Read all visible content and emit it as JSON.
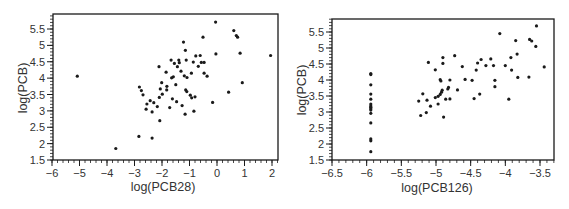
{
  "chart_data": [
    {
      "type": "scatter",
      "title": "",
      "xlabel": "log(PCB28)",
      "ylabel": "log(PCB)",
      "xlim": [
        -6,
        2.2
      ],
      "ylim": [
        1.5,
        5.9
      ],
      "xticks": [
        -6,
        -5,
        -4,
        -3,
        -2,
        -1,
        0,
        1,
        2
      ],
      "xtick_labels": [
        "−6",
        "−5",
        "−4",
        "−3",
        "−2",
        "−1",
        "0",
        "1",
        "2"
      ],
      "yticks": [
        1.5,
        2,
        2.5,
        3,
        3.5,
        4,
        4.5,
        5,
        5.5
      ],
      "ytick_labels": [
        "1.5",
        "2",
        "2.5",
        "3",
        "3.5",
        "4",
        "4.5",
        "5",
        "5.5"
      ],
      "grid": false,
      "legend": null,
      "points": [
        [
          -5.08,
          4.06
        ],
        [
          -3.68,
          1.85
        ],
        [
          -2.82,
          3.73
        ],
        [
          -2.75,
          3.62
        ],
        [
          -2.84,
          2.22
        ],
        [
          -2.36,
          2.17
        ],
        [
          -2.69,
          3.49
        ],
        [
          -2.55,
          3.21
        ],
        [
          -2.43,
          3.31
        ],
        [
          -2.58,
          3.05
        ],
        [
          -2.36,
          2.97
        ],
        [
          -2.3,
          3.25
        ],
        [
          -2.17,
          3.13
        ],
        [
          -2.11,
          4.35
        ],
        [
          -2.1,
          3.41
        ],
        [
          -2.08,
          2.7
        ],
        [
          -2.06,
          3.67
        ],
        [
          -2.01,
          3.86
        ],
        [
          -1.99,
          3.51
        ],
        [
          -1.85,
          4.18
        ],
        [
          -1.83,
          3.64
        ],
        [
          -1.82,
          3.75
        ],
        [
          -1.72,
          3.1
        ],
        [
          -1.67,
          4.55
        ],
        [
          -1.65,
          4.01
        ],
        [
          -1.62,
          3.37
        ],
        [
          -1.59,
          4.04
        ],
        [
          -1.55,
          4.45
        ],
        [
          -1.5,
          3.8
        ],
        [
          -1.47,
          3.28
        ],
        [
          -1.44,
          4.35
        ],
        [
          -1.39,
          4.55
        ],
        [
          -1.37,
          4.47
        ],
        [
          -1.31,
          4.21
        ],
        [
          -1.27,
          3.16
        ],
        [
          -1.22,
          5.1
        ],
        [
          -1.19,
          4.07
        ],
        [
          -1.16,
          2.9
        ],
        [
          -1.15,
          4.85
        ],
        [
          -1.14,
          3.64
        ],
        [
          -1.12,
          4.55
        ],
        [
          -1.09,
          4.02
        ],
        [
          -1.1,
          3.59
        ],
        [
          -0.97,
          3.48
        ],
        [
          -0.93,
          4.15
        ],
        [
          -0.92,
          3.4
        ],
        [
          -0.86,
          4.49
        ],
        [
          -0.84,
          2.99
        ],
        [
          -0.8,
          3.43
        ],
        [
          -0.77,
          4.68
        ],
        [
          -0.68,
          4.36
        ],
        [
          -0.61,
          4.69
        ],
        [
          -0.57,
          4.48
        ],
        [
          -0.51,
          5.25
        ],
        [
          -0.47,
          4.48
        ],
        [
          -0.47,
          4.15
        ],
        [
          -0.36,
          4.06
        ],
        [
          -0.16,
          3.26
        ],
        [
          -0.05,
          5.71
        ],
        [
          -0.04,
          4.74
        ],
        [
          0.42,
          3.57
        ],
        [
          0.61,
          5.45
        ],
        [
          0.7,
          5.3
        ],
        [
          0.75,
          5.25
        ],
        [
          0.84,
          4.76
        ],
        [
          0.92,
          3.86
        ],
        [
          1.95,
          4.69
        ]
      ]
    },
    {
      "type": "scatter",
      "title": "",
      "xlabel": "log(PCB126)",
      "ylabel": "log(PCB)",
      "xlim": [
        -6.5,
        -3.3
      ],
      "ylim": [
        1.5,
        5.9
      ],
      "xticks": [
        -6.5,
        -6,
        -5.5,
        -5,
        -4.5,
        -4,
        -3.5
      ],
      "xtick_labels": [
        "−6.5",
        "−6",
        "−5.5",
        "−5",
        "−4.5",
        "−4",
        "−3.5"
      ],
      "yticks": [
        1.5,
        2,
        2.5,
        3,
        3.5,
        4,
        4.5,
        5,
        5.5
      ],
      "ytick_labels": [
        "1.5",
        "2",
        "2.5",
        "3",
        "3.5",
        "4",
        "4.5",
        "5",
        "5.5"
      ],
      "grid": false,
      "legend": null,
      "points": [
        [
          -5.94,
          4.2
        ],
        [
          -5.94,
          4.17
        ],
        [
          -5.94,
          3.85
        ],
        [
          -5.94,
          3.56
        ],
        [
          -5.94,
          3.4
        ],
        [
          -5.94,
          3.25
        ],
        [
          -5.94,
          3.19
        ],
        [
          -5.94,
          3.15
        ],
        [
          -5.94,
          3.1
        ],
        [
          -5.94,
          3.06
        ],
        [
          -5.94,
          2.96
        ],
        [
          -5.94,
          2.66
        ],
        [
          -5.94,
          2.16
        ],
        [
          -5.94,
          2.1
        ],
        [
          -5.94,
          1.76
        ],
        [
          -5.25,
          3.34
        ],
        [
          -5.22,
          2.89
        ],
        [
          -5.19,
          3.57
        ],
        [
          -5.14,
          2.98
        ],
        [
          -5.13,
          3.37
        ],
        [
          -5.11,
          4.55
        ],
        [
          -5.08,
          3.18
        ],
        [
          -5.01,
          4.32
        ],
        [
          -5.01,
          3.45
        ],
        [
          -4.97,
          3.25
        ],
        [
          -4.97,
          3.49
        ],
        [
          -4.94,
          4.01
        ],
        [
          -4.94,
          3.55
        ],
        [
          -4.93,
          3.97
        ],
        [
          -4.92,
          3.62
        ],
        [
          -4.91,
          3.68
        ],
        [
          -4.9,
          4.7
        ],
        [
          -4.9,
          4.52
        ],
        [
          -4.89,
          2.84
        ],
        [
          -4.86,
          3.4
        ],
        [
          -4.83,
          3.72
        ],
        [
          -4.82,
          3.77
        ],
        [
          -4.8,
          3.41
        ],
        [
          -4.8,
          4.0
        ],
        [
          -4.73,
          4.76
        ],
        [
          -4.69,
          3.69
        ],
        [
          -4.62,
          4.42
        ],
        [
          -4.58,
          4.02
        ],
        [
          -4.48,
          3.99
        ],
        [
          -4.45,
          3.42
        ],
        [
          -4.42,
          4.31
        ],
        [
          -4.4,
          4.53
        ],
        [
          -4.37,
          3.56
        ],
        [
          -4.35,
          4.64
        ],
        [
          -4.28,
          4.45
        ],
        [
          -4.21,
          4.66
        ],
        [
          -4.17,
          4.45
        ],
        [
          -4.15,
          3.99
        ],
        [
          -4.15,
          3.79
        ],
        [
          -4.08,
          5.45
        ],
        [
          -4.0,
          4.45
        ],
        [
          -3.95,
          3.4
        ],
        [
          -3.92,
          4.7
        ],
        [
          -3.91,
          4.31
        ],
        [
          -3.85,
          5.23
        ],
        [
          -3.83,
          4.81
        ],
        [
          -3.82,
          4.08
        ],
        [
          -3.66,
          4.09
        ],
        [
          -3.65,
          5.27
        ],
        [
          -3.62,
          5.22
        ],
        [
          -3.56,
          5.05
        ],
        [
          -3.55,
          5.69
        ],
        [
          -3.44,
          4.41
        ]
      ]
    }
  ],
  "layout": {
    "panels": [
      {
        "frame": {
          "left": 53,
          "top": 14,
          "right": 278,
          "bottom": 160
        },
        "x_px": {
          "v0": -6,
          "p0": 52,
          "v1": 2,
          "p1": 272
        },
        "y_px": {
          "v0": 1.5,
          "p0": 160,
          "v1": 5.5,
          "p1": 29
        },
        "xlabel_pos": [
          163,
          191
        ],
        "ylabel_pos": [
          27,
          88
        ]
      },
      {
        "frame": {
          "left": 332,
          "top": 19,
          "right": 554,
          "bottom": 160
        },
        "x_px": {
          "v0": -6.5,
          "p0": 332,
          "v1": -3.5,
          "p1": 540
        },
        "y_px": {
          "v0": 1.5,
          "p0": 160,
          "v1": 5.5,
          "p1": 32
        },
        "xlabel_pos": [
          437,
          192
        ],
        "ylabel_pos": [
          306,
          90
        ]
      }
    ],
    "ink": "#1a1a1a"
  }
}
